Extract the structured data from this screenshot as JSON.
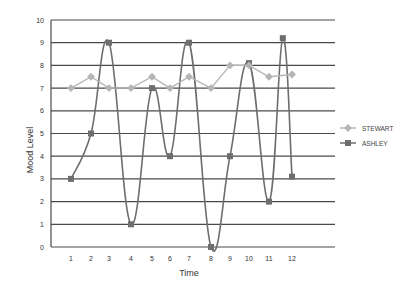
{
  "chart_data": {
    "type": "line",
    "title": "",
    "xlabel": "Time",
    "ylabel": "Mood Level",
    "categories": [
      "1",
      "2",
      "3",
      "4",
      "5",
      "6",
      "7",
      "8",
      "9",
      "10",
      "11",
      "12"
    ],
    "ylim": [
      0,
      10
    ],
    "yticks": [
      "0",
      "1",
      "2",
      "3",
      "4",
      "5",
      "6",
      "7",
      "8",
      "9",
      "10"
    ],
    "grid": true,
    "legend_position": "right",
    "series": [
      {
        "name": "STEWART",
        "color": "#b5b5b5",
        "marker": "diamond",
        "smooth": false,
        "x": [
          1,
          2,
          3,
          4,
          5,
          6,
          7,
          8,
          9,
          10,
          11,
          12
        ],
        "values": [
          7,
          7.5,
          7,
          7,
          7.5,
          7,
          7.5,
          7,
          8,
          8,
          7.5,
          7.6
        ]
      },
      {
        "name": "ASHLEY",
        "color": "#6e6e6e",
        "marker": "square",
        "smooth": true,
        "x": [
          1,
          2,
          3,
          4,
          5,
          6,
          7,
          8,
          9,
          10,
          11,
          11.6,
          12
        ],
        "values": [
          3,
          5,
          9,
          1,
          7,
          4,
          9,
          0,
          4,
          8.1,
          2,
          9.2,
          3.1
        ]
      }
    ]
  }
}
